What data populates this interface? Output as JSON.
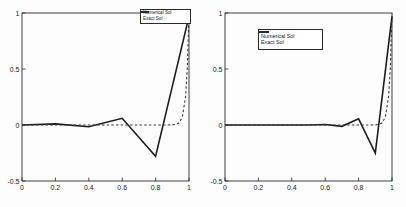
{
  "figure": {
    "background": "#fdfdfd",
    "axis_color": "#2a2a2a",
    "num_charts": 2
  },
  "chart_data": [
    {
      "type": "line",
      "name": "coarse-mesh-solution",
      "title": "",
      "xlabel": "",
      "ylabel": "",
      "xlim": [
        0,
        1
      ],
      "ylim": [
        -0.5,
        1
      ],
      "grid": false,
      "x_tick_labels": [
        "0",
        "0.2",
        "0.4",
        "0.6",
        "0.8",
        "1"
      ],
      "y_tick_labels": [
        "-0.5",
        "0",
        "0.5",
        "1"
      ],
      "legend": {
        "position": "top-right",
        "items": [
          {
            "label": "Numerical Sol",
            "line": "solid"
          },
          {
            "label": "Exact Sol",
            "line": "dashed"
          }
        ]
      },
      "series": [
        {
          "name": "Numerical Sol",
          "style": "solid",
          "color": "#1c1c1c",
          "width": 1.6,
          "x": [
            0,
            0.2,
            0.4,
            0.6,
            0.8,
            1
          ],
          "y": [
            0,
            0.01,
            -0.015,
            0.06,
            -0.28,
            0.97
          ]
        },
        {
          "name": "Exact Sol",
          "style": "dashed",
          "color": "#3a3a3a",
          "width": 1.1,
          "x": [
            0,
            0.1,
            0.2,
            0.3,
            0.4,
            0.5,
            0.6,
            0.7,
            0.8,
            0.85,
            0.9,
            0.92,
            0.94,
            0.96,
            0.98,
            0.99,
            1
          ],
          "y": [
            0,
            0,
            0,
            0,
            0,
            0,
            0,
            0,
            0,
            0,
            0.001,
            0.005,
            0.018,
            0.07,
            0.26,
            0.51,
            1
          ]
        }
      ]
    },
    {
      "type": "line",
      "name": "fine-mesh-solution",
      "title": "",
      "xlabel": "",
      "ylabel": "",
      "xlim": [
        0,
        1
      ],
      "ylim": [
        -0.5,
        1
      ],
      "grid": false,
      "x_tick_labels": [
        "0",
        "0.2",
        "0.4",
        "0.6",
        "0.8",
        "1"
      ],
      "y_tick_labels": [
        "-0.5",
        "0",
        "0.5",
        "1"
      ],
      "legend": {
        "position": "upper-center-left",
        "items": [
          {
            "label": "Numerical Sol",
            "line": "solid"
          },
          {
            "label": "Exact Sol",
            "line": "dashed"
          }
        ]
      },
      "series": [
        {
          "name": "Numerical Sol",
          "style": "solid",
          "color": "#1c1c1c",
          "width": 1.6,
          "x": [
            0,
            0.1,
            0.2,
            0.3,
            0.4,
            0.5,
            0.6,
            0.7,
            0.8,
            0.9,
            1
          ],
          "y": [
            0,
            0,
            0,
            0,
            0,
            0,
            0.004,
            -0.012,
            0.055,
            -0.25,
            0.97
          ]
        },
        {
          "name": "Exact Sol",
          "style": "dashed",
          "color": "#3a3a3a",
          "width": 1.1,
          "x": [
            0,
            0.1,
            0.2,
            0.3,
            0.4,
            0.5,
            0.6,
            0.7,
            0.8,
            0.85,
            0.9,
            0.92,
            0.94,
            0.96,
            0.98,
            0.99,
            1
          ],
          "y": [
            0,
            0,
            0,
            0,
            0,
            0,
            0,
            0,
            0,
            0,
            0.001,
            0.005,
            0.018,
            0.07,
            0.26,
            0.51,
            1
          ]
        }
      ]
    }
  ]
}
